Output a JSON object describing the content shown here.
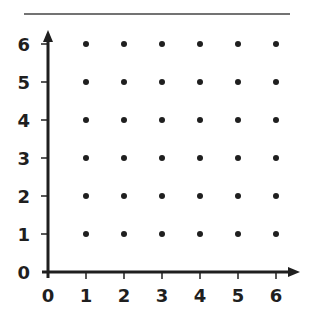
{
  "chart_data": {
    "type": "scatter",
    "title": "",
    "xlabel": "",
    "ylabel": "",
    "xlim": [
      0,
      6
    ],
    "ylim": [
      0,
      6
    ],
    "x_ticks": [
      "0",
      "1",
      "2",
      "3",
      "4",
      "5",
      "6"
    ],
    "y_ticks": [
      "0",
      "1",
      "2",
      "3",
      "4",
      "5",
      "6"
    ],
    "grid": false,
    "legend": null,
    "points_x": [
      1,
      2,
      3,
      4,
      5,
      6
    ],
    "points_y": [
      1,
      2,
      3,
      4,
      5,
      6
    ]
  },
  "colors": {
    "ink": "#1f1f1f",
    "rule": "#444444"
  }
}
